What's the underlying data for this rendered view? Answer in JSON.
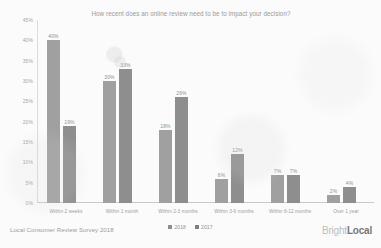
{
  "footer": {
    "source": "Local Consumer Review Survey 2018",
    "brand_first": "Bright",
    "brand_second": "Local"
  },
  "legend": {
    "items": [
      {
        "label": "2018",
        "color": "#8e8e8e"
      },
      {
        "label": "2017",
        "color": "#7f7f7f"
      }
    ]
  },
  "chart_data": {
    "type": "bar",
    "title": "How recent does an online review need to be to impact your decision?",
    "xlabel": "",
    "ylabel": "",
    "ylim": [
      0,
      45
    ],
    "grid": false,
    "legend_position": "bottom",
    "ytick_labels": [
      "45%",
      "40%",
      "35%",
      "30%",
      "25%",
      "20%",
      "15%",
      "10%",
      "5%",
      "0%"
    ],
    "ytick_values": [
      45,
      40,
      35,
      30,
      25,
      20,
      15,
      10,
      5,
      0
    ],
    "categories": [
      "Within 2 weeks",
      "Within 1 month",
      "Within 2-3 months",
      "Within 3-6 months",
      "Within 6-12 months",
      "Over 1 year"
    ],
    "series": [
      {
        "name": "2018",
        "color": "#a0a0a0",
        "values": [
          40,
          30,
          18,
          6,
          7,
          2
        ],
        "labels": [
          "40%",
          "30%",
          "18%",
          "6%",
          "7%",
          "2%"
        ]
      },
      {
        "name": "2017",
        "color": "#8e8e8e",
        "values": [
          19,
          33,
          26,
          12,
          7,
          4
        ],
        "labels": [
          "19%",
          "33%",
          "26%",
          "12%",
          "7%",
          "4%"
        ]
      }
    ]
  }
}
